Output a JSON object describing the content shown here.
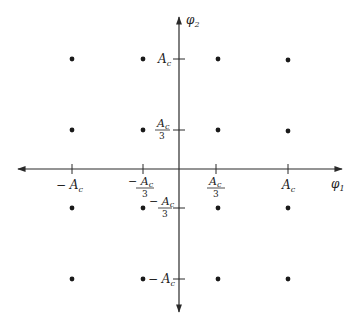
{
  "diagram": {
    "type": "signal-constellation-16-point",
    "axes": {
      "horizontal_label": "φ",
      "horizontal_sub": "1",
      "vertical_label": "φ",
      "vertical_sub": "2"
    },
    "x_ticks": [
      {
        "text": "− A",
        "sub": "c",
        "fraction": false
      },
      {
        "text": "− A",
        "sub": "c",
        "fraction": true,
        "den": "3"
      },
      {
        "text": "A",
        "sub": "c",
        "fraction": true,
        "den": "3"
      },
      {
        "text": "A",
        "sub": "c",
        "fraction": false
      }
    ],
    "y_ticks": [
      {
        "text": "A",
        "sub": "c",
        "fraction": false
      },
      {
        "text": "A",
        "sub": "c",
        "fraction": true,
        "den": "3"
      },
      {
        "text": "− A",
        "sub": "c",
        "fraction": true,
        "den": "3"
      },
      {
        "text": "− A",
        "sub": "c",
        "fraction": false
      }
    ],
    "points": {
      "columns": [
        "-A_c",
        "-A_c/3",
        "A_c/3",
        "A_c"
      ],
      "rows": [
        "A_c",
        "A_c/3",
        "-A_c/3",
        "-A_c"
      ],
      "count": 16
    },
    "colors": {
      "ink": "#222222",
      "background": "#ffffff"
    }
  }
}
